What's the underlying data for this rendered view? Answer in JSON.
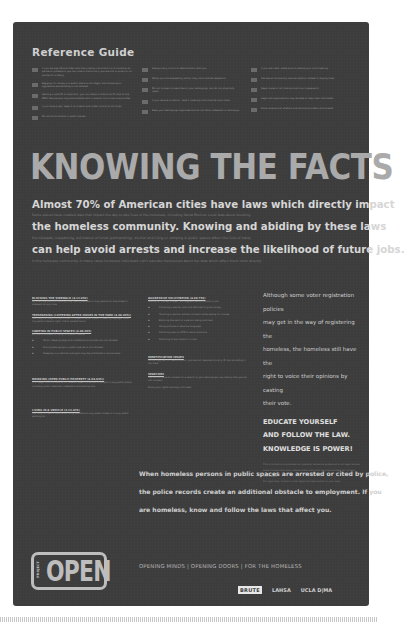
{
  "reference_guide": {
    "title": "Reference Guide",
    "columns": [
      [
        "If you are age 18 and older who has a felony conviction (or is currently on parole or probation) you can vote in California if you are not in prison or on parole for a felony.",
        "Begging for money in a public place is not illegal, but harassing or aggressive panhandling is not allowed.",
        "Getting a valid ID is important; you can obtain a California ID card at the DMV. Fee waivers may be available with a referral from a service provider.",
        "If you have a pet, keep it on a leash and under control at all times.",
        "Do not drink alcohol in public places."
      ],
      [
        "Always carry a form of identification with you.",
        "When you are stopped by police, stay calm and be respectful.",
        "Do not consent to searches of your belongings, but do not physically resist.",
        "If you receive a citation, read it carefully and note the court date.",
        "Keep your belongings organized and do not block sidewalks or doorways."
      ],
      [
        "If you are cited, make sure to attend your court hearing.",
        "Ask about community service options instead of paying fines.",
        "Keep copies of all citations and court paperwork.",
        "Legal aid organizations may be able to help clear old tickets.",
        "Know where local shelters and service providers are located."
      ]
    ]
  },
  "headline": "KNOWING THE FACTS",
  "statement": {
    "big_lines": [
      "Almost 70% of American cities have laws which directly impact",
      "the homeless community. Knowing and abiding by these laws",
      "can help avoid arrests and increase the likelihood of future jobs."
    ],
    "small_lines": [
      "Some places have created laws that impact the day to day lives of the homeless, including Santa Monica. Local laws about blocking",
      "the sidewalk, trespassing, solicitation of funds (panhandling), alcohol and living or camping in public spaces affect the lives of many",
      "in the homeless community. In many cases homeless individuals can't educate themselves about the laws which affect them most directly."
    ]
  },
  "left_column": {
    "sections": [
      {
        "heading": "BLOCKING THE SIDEWALK (4.12.050)",
        "body": "No one may block or obstruct the free movement of any person on the street or sidewalk at any time."
      },
      {
        "heading": "TRESPASSING (LOITERING AFTER HOURS IN THE PARK (4.08.095))",
        "body": "You may not stay in a park after it closes or enter a park closed by signage. Most city parks close at night; check posted hours."
      },
      {
        "heading": "CAMPING IN PUBLIC SPACES (4.08.095)",
        "body": "No one is allowed to camp in a public space.",
        "items": [
          "Tents, sleeping bags and cardboard structures are not allowed.",
          "Storing belongings in public spaces is not allowed.",
          "Sleeping in a vehicle overnight may be prohibited in some areas."
        ]
      },
      {
        "heading": "DRINKING (OPEN PUBLIC PROPERTY (4.08.035))",
        "body": "It is illegal to drink alcohol or have an open container of alcohol in any public place including parks, beaches, sidewalks and parking lots."
      },
      {
        "heading": "LIVING IN A VEHICLE (3.12.870)",
        "body": "You may not use a vehicle as living quarters on any public street or in any public parking lot."
      }
    ]
  },
  "middle_column": {
    "sections": [
      {
        "heading": "AGGRESSIVE SOLICITATION (4.08.750)",
        "body": "Asking for money is legal, but aggressive solicitation is not.",
        "items": [
          "Following a person who has declined to give money.",
          "Touching a person without consent while asking for money.",
          "Blocking the path of a person being solicited.",
          "Using profane or abusive language.",
          "Soliciting near an ATM or bank entrance.",
          "Soliciting at bus stops or in line."
        ]
      },
      {
        "heading": "IDENTIFICATION ISSUES",
        "body": "Police may ask for identification; you are not required to carry ID, but providing it can help."
      },
      {
        "heading": "SEARCHES",
        "body": "You do not have to consent to a search of your belongings; say clearly that you do not consent."
      },
      {
        "heading": "",
        "body": "Know your rights and stay informed."
      }
    ]
  },
  "right_column": {
    "voter_lines": [
      "Although some voter registration policies",
      "may get in the way of registering the",
      "homeless, the homeless still have the",
      "right to voice their opinions by casting",
      "their vote."
    ],
    "educate_lines": [
      "EDUCATE YOURSELF",
      "AND FOLLOW THE LAW.",
      "KNOWLEDGE IS POWER!"
    ],
    "fine_lines": [
      "This information is provided as a general reference guide and is not legal advice.",
      "Laws change over time; please check with local service providers for current information.",
      "For legal help, contact a local legal aid organization in your area."
    ]
  },
  "arrest_statement": [
    "When homeless persons in public spaces are arrested or cited by police,",
    "the police records create an additional obstacle to employment. If you",
    "are homeless, know and follow the laws that affect you."
  ],
  "footer": {
    "logo_small": "PROJECT",
    "logo_big": "OPEN",
    "tagline": "OPENING MINDS  |  OPENING DOORS  |  FOR THE HOMELESS",
    "partners": [
      "BRUTE",
      "LAHSA",
      "UCLA D|MA"
    ]
  }
}
